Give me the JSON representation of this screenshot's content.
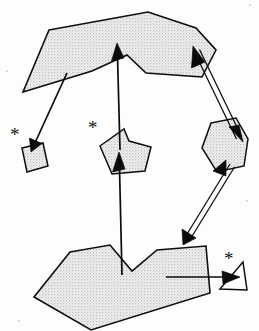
{
  "figure": {
    "canvas": {
      "width": 259,
      "height": 331
    },
    "background_color": "#fdfdfc",
    "ink_color": "#0b0b0b",
    "fill_color": "#e2e2e2",
    "fill_style": "stipple-halftone-gray",
    "annotation_glyph": "✳",
    "asterisk_char": "*"
  },
  "shapes": [
    {
      "id": "top-polygon",
      "name": "top-large-polygon",
      "points": "49,30 148,12 196,28 216,50 202,77 146,73 127,55 92,71 23,92",
      "label": "A"
    },
    {
      "id": "bottom-polygon",
      "name": "bottom-large-polygon",
      "points": "70,252 110,245 132,271 157,250 206,246 210,293 91,330 34,297",
      "label": "B"
    },
    {
      "id": "center-pentagon",
      "name": "center-pentagon",
      "points": "100,146 124,129 129,141 151,147 145,171 112,174",
      "label": "C"
    },
    {
      "id": "right-pentagon",
      "name": "right-pentagon",
      "points": "211,123 236,118 248,139 244,166 217,172 202,148",
      "label": "D"
    },
    {
      "id": "small-quad",
      "name": "small-quadrilateral",
      "points": "22,148 43,143 48,166 27,172",
      "label": "E"
    },
    {
      "id": "small-triangle",
      "name": "small-triangle",
      "points": "243,262 247,290 220,289",
      "label": "F"
    }
  ],
  "arrows": [
    {
      "id": "arrow-top-to-quad",
      "name": "arrow-top-polygon-to-small-quad",
      "style": "single-line",
      "from": [
        67,
        73
      ],
      "to": [
        31,
        151
      ],
      "heads": [
        "to"
      ]
    },
    {
      "id": "arrow-center-up",
      "name": "arrow-center-pentagon-to-top-polygon",
      "style": "single-line",
      "from": [
        120,
        148
      ],
      "to": [
        117,
        48
      ],
      "heads": [
        "to"
      ]
    },
    {
      "id": "arrow-bottom-up",
      "name": "arrow-bottom-polygon-to-center-pentagon",
      "style": "single-line",
      "from": [
        122,
        273
      ],
      "to": [
        119,
        157
      ],
      "heads": [
        "to"
      ]
    },
    {
      "id": "arrow-top-right-double",
      "name": "double-arrow-top-polygon-to-right-pentagon",
      "style": "double-line",
      "from": [
        196,
        50
      ],
      "to": [
        238,
        137
      ],
      "heads": [
        "from",
        "to"
      ]
    },
    {
      "id": "arrow-right-bottom-double",
      "name": "double-arrow-right-pentagon-to-bottom-polygon",
      "style": "double-line",
      "from": [
        232,
        163
      ],
      "to": [
        183,
        241
      ],
      "heads": [
        "from",
        "to"
      ]
    },
    {
      "id": "arrow-bottom-to-triangle",
      "name": "arrow-bottom-polygon-to-small-triangle",
      "style": "single-line",
      "from": [
        166,
        277
      ],
      "to": [
        234,
        277
      ],
      "heads": [
        "to"
      ]
    }
  ],
  "annotations": [
    {
      "id": "asterisk-left",
      "name": "asterisk-near-small-quad",
      "text": "*",
      "x": 10,
      "y": 125,
      "size": 19
    },
    {
      "id": "asterisk-center",
      "name": "asterisk-near-center-pentagon",
      "text": "*",
      "x": 88,
      "y": 118,
      "size": 19
    },
    {
      "id": "asterisk-right",
      "name": "asterisk-near-small-triangle",
      "text": "*",
      "x": 224,
      "y": 249,
      "size": 19
    }
  ]
}
